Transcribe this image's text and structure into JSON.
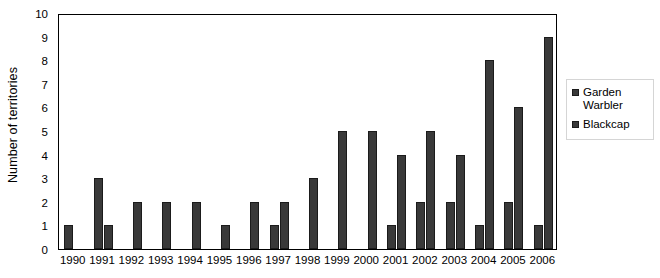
{
  "chart_data": {
    "type": "bar",
    "title": "",
    "subtitle": "",
    "xlabel": "",
    "ylabel": "Number of territories",
    "categories": [
      "1990",
      "1991",
      "1992",
      "1993",
      "1994",
      "1995",
      "1996",
      "1997",
      "1998",
      "1999",
      "2000",
      "2001",
      "2002",
      "2003",
      "2004",
      "2005",
      "2006"
    ],
    "series": [
      {
        "name": "Garden Warbler",
        "values": [
          1,
          3,
          0,
          0,
          0,
          0,
          0,
          1,
          0,
          0,
          0,
          1,
          2,
          2,
          1,
          2,
          1
        ]
      },
      {
        "name": "Blackcap",
        "values": [
          0,
          1,
          2,
          2,
          2,
          1,
          2,
          2,
          3,
          5,
          5,
          4,
          5,
          4,
          8,
          6,
          9
        ]
      }
    ],
    "ylim": [
      0,
      10
    ],
    "y_ticks": [
      "0",
      "1",
      "2",
      "3",
      "4",
      "5",
      "6",
      "7",
      "8",
      "9",
      "10"
    ],
    "grid": false,
    "legend_position": "right",
    "bar_color": "#393939",
    "bar_edge_color": "#1b1b1b",
    "axis_color": "#000000"
  },
  "axes": {
    "y_title": "Number of territories"
  },
  "legend": {
    "entries": [
      {
        "label": "Garden\nWarbler",
        "color": "#393939"
      },
      {
        "label": "Blackcap",
        "color": "#393939"
      }
    ]
  }
}
